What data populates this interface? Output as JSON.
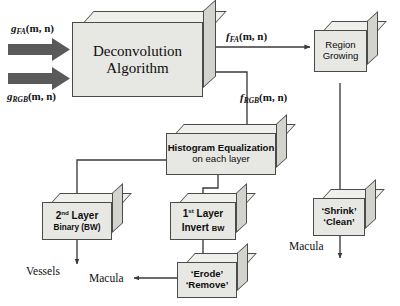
{
  "diagram": {
    "colors": {
      "box_face": "#e7e7e3",
      "box_top": "#efefeb",
      "box_side": "#d3d3cd",
      "outline": "#4a4a4a",
      "block_arrow": "#5a5a5a",
      "connector": "#3a3a3a",
      "text": "#111111"
    },
    "inputs": [
      {
        "id": "g-fa",
        "base": "g",
        "sub": "FA",
        "args": "(m, n)"
      },
      {
        "id": "g-rgb",
        "base": "g",
        "sub": "RGB",
        "args": "(m, n)"
      }
    ],
    "edge_labels": [
      {
        "id": "f-fa",
        "base": "f",
        "sub": "FA",
        "args": "(m, n)"
      },
      {
        "id": "f-rgb",
        "base": "f",
        "sub": "RGB",
        "args": "(m, n)"
      }
    ],
    "nodes": {
      "deconvolution": {
        "line1": "Deconvolution",
        "line2": "Algorithm"
      },
      "region_growing": {
        "line1": "Region",
        "line2": "Growing"
      },
      "histogram": {
        "line1": "Histogram Equalization",
        "line2": "on each layer"
      },
      "second_layer": {
        "line1_pre": "2",
        "line1_sup": "nd",
        "line1_post": " Layer",
        "line2": "Binary (BW)"
      },
      "first_layer": {
        "line1_pre": "1",
        "line1_sup": "st",
        "line1_post": " Layer",
        "line2_pre": "Invert ",
        "line2_small": "BW"
      },
      "shrink_clean": {
        "line1": "‘Shrink’",
        "line2": "‘Clean’"
      },
      "erode_remove": {
        "line1": "‘Erode’",
        "line2": "‘Remove’"
      }
    },
    "outputs": [
      {
        "id": "vessels",
        "label": "Vessels"
      },
      {
        "id": "macula-left",
        "label": "Macula"
      },
      {
        "id": "macula-right",
        "label": "Macula"
      }
    ]
  }
}
